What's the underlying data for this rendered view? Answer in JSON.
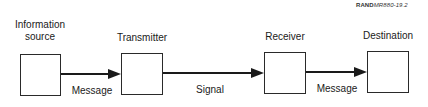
{
  "figure_id": {
    "bold": "RAND",
    "italic": "MR880-19.2"
  },
  "nodes": [
    {
      "label_line1": "Information",
      "label_line2": "source"
    },
    {
      "label_line1": "Transmitter"
    },
    {
      "label_line1": "Receiver"
    },
    {
      "label_line1": "Destination"
    }
  ],
  "edges": [
    {
      "from": "Information source",
      "to": "Transmitter",
      "label": "Message"
    },
    {
      "from": "Transmitter",
      "to": "Receiver",
      "label": "Signal"
    },
    {
      "from": "Receiver",
      "to": "Destination",
      "label": "Message"
    }
  ],
  "colors": {
    "stroke": "#1a1a1a",
    "background": "#ffffff"
  }
}
